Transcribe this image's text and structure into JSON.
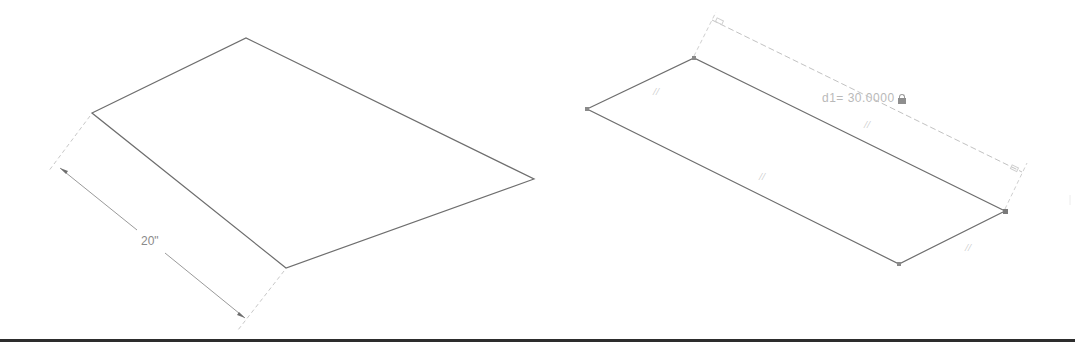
{
  "left_sketch": {
    "shape": "quadrilateral",
    "vertices": [
      [
        92,
        113
      ],
      [
        246,
        38
      ],
      [
        534,
        179
      ],
      [
        286,
        268
      ]
    ],
    "dimension": {
      "label": "20\"",
      "from": [
        61,
        170
      ],
      "to": [
        244,
        318
      ]
    }
  },
  "right_sketch": {
    "shape": "parallelogram",
    "vertices": [
      [
        587,
        109
      ],
      [
        694,
        58
      ],
      [
        1005,
        211
      ],
      [
        899,
        264
      ]
    ],
    "dimension": {
      "name": "d1",
      "label": "d1= 30.0000",
      "locked": true,
      "icon": "lock-icon"
    },
    "constraints": [
      {
        "type": "parallel",
        "symbol": "//"
      },
      {
        "type": "parallel",
        "symbol": "//"
      },
      {
        "type": "parallel",
        "symbol": "//"
      },
      {
        "type": "parallel",
        "symbol": "//"
      }
    ]
  },
  "colors": {
    "geometry": "#6e6e6e",
    "dimension": "#9a9a9a",
    "extension": "#c8c8c8",
    "vertex": "#8a8a8a",
    "rule": "#2d2d2d"
  }
}
